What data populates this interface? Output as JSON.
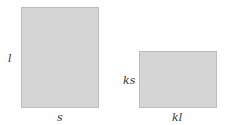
{
  "diagram": {
    "rect_original": {
      "width_label": "s",
      "height_label": "l"
    },
    "rect_scaled": {
      "width_label": "kl",
      "height_label": "ks"
    },
    "colors": {
      "fill": "#d5d5d5",
      "border": "#bdbdbd",
      "text": "#333333"
    }
  }
}
